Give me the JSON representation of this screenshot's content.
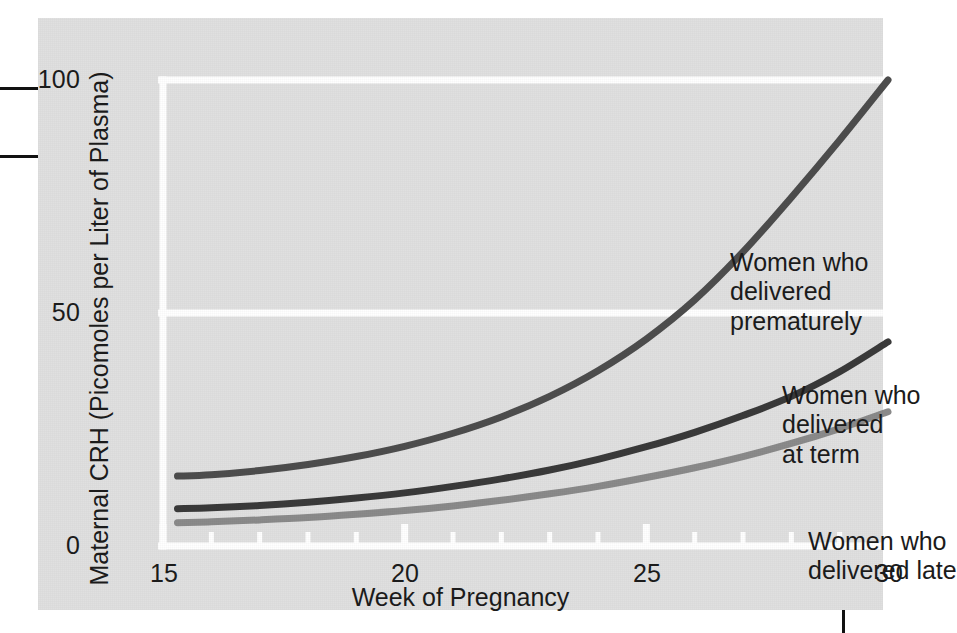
{
  "figure": {
    "background_color": "#e0e0e0",
    "grid_color": "#ffffff",
    "text_color": "#1b1b1b"
  },
  "axes": {
    "x_title": "Week of Pregnancy",
    "y_title": "Maternal CRH (Picomoles per Liter of Plasma)",
    "x_ticks": [
      "15",
      "20",
      "25",
      "30"
    ],
    "y_ticks": [
      "100",
      "50",
      "0"
    ]
  },
  "annotations": {
    "premature": "Women who\ndelivered\nprematurely",
    "term": "Women who\ndelivered\nat term",
    "late": "Women who\ndelivered late"
  },
  "chart_data": {
    "type": "line",
    "title": "",
    "xlabel": "Week of Pregnancy",
    "ylabel": "Maternal CRH (Picomoles per Liter of Plasma)",
    "xlim": [
      15,
      30
    ],
    "ylim": [
      0,
      100
    ],
    "xticks": [
      15,
      20,
      25,
      30
    ],
    "yticks": [
      0,
      50,
      100
    ],
    "x_minor_tick_step": 1,
    "grid": "horizontal gridlines at 0, 50, 100 plus plot border, drawn in white",
    "legend": "inline annotations next to each curve",
    "x": [
      15.3,
      16,
      17,
      18,
      19,
      20,
      21,
      22,
      23,
      24,
      25,
      26,
      27,
      28,
      29,
      30
    ],
    "series": [
      {
        "name": "Women who delivered prematurely",
        "color": "#4d4d4d",
        "values": [
          15.0,
          15.3,
          16.2,
          17.5,
          19.2,
          21.4,
          24.2,
          27.7,
          32.1,
          37.6,
          44.4,
          52.8,
          63.1,
          74.8,
          87.1,
          100.0
        ]
      },
      {
        "name": "Women who delivered at term",
        "color": "#3a3a3a",
        "values": [
          8.0,
          8.2,
          8.7,
          9.4,
          10.3,
          11.4,
          12.8,
          14.4,
          16.3,
          18.6,
          21.3,
          24.4,
          28.0,
          32.1,
          37.4,
          43.8
        ]
      },
      {
        "name": "Women who delivered late",
        "color": "#8a8a8a",
        "values": [
          5.0,
          5.2,
          5.6,
          6.1,
          6.8,
          7.6,
          8.6,
          9.8,
          11.2,
          12.8,
          14.7,
          16.8,
          19.2,
          22.0,
          25.2,
          28.8
        ]
      }
    ]
  }
}
